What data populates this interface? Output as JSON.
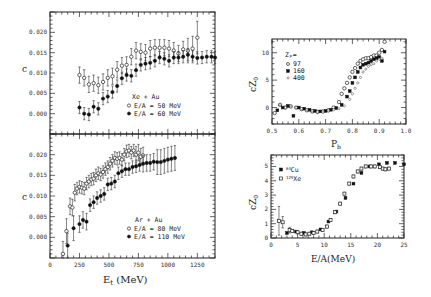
{
  "chart_data": [
    {
      "id": "xe-au",
      "type": "scatter",
      "title": "",
      "xlabel": "",
      "ylabel": "c",
      "xlim": [
        0,
        1400
      ],
      "ylim": [
        -0.005,
        0.025
      ],
      "yticks": [
        0.0,
        0.005,
        0.01,
        0.015,
        0.02
      ],
      "ytick_labels": [
        "0.000",
        "0.005",
        "0.010",
        "0.015",
        "0.020"
      ],
      "legend_title": "Xe + Au",
      "legend_position": "lower-center",
      "series": [
        {
          "name": "E/A = 50 MeV",
          "marker": "open-circle",
          "x": [
            250,
            290,
            330,
            370,
            410,
            450,
            490,
            530,
            570,
            610,
            650,
            690,
            730,
            770,
            810,
            850,
            890,
            930,
            970,
            1010,
            1050,
            1090,
            1130,
            1170,
            1210,
            1250
          ],
          "y": [
            0.0095,
            0.0088,
            0.0072,
            0.0075,
            0.007,
            0.0078,
            0.0088,
            0.0092,
            0.0108,
            0.0118,
            0.012,
            0.014,
            0.0155,
            0.0152,
            0.015,
            0.016,
            0.0162,
            0.0162,
            0.0162,
            0.016,
            0.0155,
            0.0148,
            0.0158,
            0.0155,
            0.016,
            0.0187
          ],
          "err": [
            0.002,
            0.002,
            0.002,
            0.002,
            0.002,
            0.002,
            0.002,
            0.002,
            0.002,
            0.002,
            0.002,
            0.002,
            0.002,
            0.002,
            0.002,
            0.002,
            0.002,
            0.002,
            0.002,
            0.002,
            0.002,
            0.002,
            0.002,
            0.003,
            0.003,
            0.004
          ]
        },
        {
          "name": "E/A = 60 MeV",
          "marker": "filled-circle",
          "x": [
            250,
            290,
            330,
            370,
            410,
            450,
            490,
            530,
            570,
            610,
            650,
            690,
            730,
            770,
            810,
            850,
            890,
            930,
            970,
            1010,
            1050,
            1090,
            1130,
            1170,
            1210,
            1250,
            1290,
            1330,
            1370,
            1400
          ],
          "y": [
            0.0015,
            0.0,
            -0.0002,
            0.0017,
            0.0012,
            0.0037,
            0.0042,
            0.0053,
            0.0068,
            0.0087,
            0.0095,
            0.0093,
            0.0107,
            0.012,
            0.0123,
            0.0125,
            0.013,
            0.0138,
            0.0135,
            0.013,
            0.0138,
            0.0138,
            0.014,
            0.0145,
            0.014,
            0.0137,
            0.0138,
            0.014,
            0.014,
            0.0138
          ],
          "err": [
            0.0015,
            0.0015,
            0.0015,
            0.0015,
            0.0015,
            0.0015,
            0.0015,
            0.0015,
            0.0015,
            0.0015,
            0.0015,
            0.0015,
            0.0015,
            0.0015,
            0.0015,
            0.0015,
            0.0015,
            0.0015,
            0.0015,
            0.0015,
            0.0015,
            0.0015,
            0.0015,
            0.0015,
            0.0015,
            0.0015,
            0.0015,
            0.0015,
            0.0015,
            0.0015
          ]
        }
      ]
    },
    {
      "id": "ar-au",
      "type": "scatter",
      "xlabel": "Eₜ (MeV)",
      "ylabel": "c",
      "xlim": [
        0,
        1400
      ],
      "ylim": [
        -0.005,
        0.025
      ],
      "xticks": [
        0,
        250,
        500,
        750,
        1000,
        1250
      ],
      "xtick_labels": [
        "0",
        "250",
        "500",
        "750",
        "1000",
        "1250"
      ],
      "yticks": [
        0.0,
        0.005,
        0.01,
        0.015,
        0.02
      ],
      "ytick_labels": [
        "0.000",
        "0.005",
        "0.010",
        "0.015",
        "0.020"
      ],
      "legend_title": "Ar + Au",
      "legend_position": "lower-right",
      "series": [
        {
          "name": "E/A = 80 MeV",
          "marker": "open-circle",
          "x": [
            110,
            140,
            170,
            190,
            210,
            230,
            250,
            270,
            290,
            310,
            330,
            350,
            370,
            390,
            410,
            430,
            450,
            470,
            490,
            510,
            530,
            550,
            570,
            590,
            610,
            630,
            650,
            670,
            690,
            710,
            730,
            750,
            770,
            790
          ],
          "y": [
            -0.004,
            0.0015,
            0.0075,
            0.0072,
            0.0108,
            0.0118,
            0.0122,
            0.012,
            0.0118,
            0.013,
            0.0135,
            0.014,
            0.0142,
            0.015,
            0.0155,
            0.0152,
            0.0158,
            0.0165,
            0.017,
            0.0178,
            0.0185,
            0.0192,
            0.019,
            0.0192,
            0.0188,
            0.02,
            0.0208,
            0.021,
            0.0205,
            0.021,
            0.02,
            0.0205,
            0.0195,
            0.0198
          ],
          "err": [
            0.003,
            0.003,
            0.002,
            0.002,
            0.002,
            0.0015,
            0.0015,
            0.0015,
            0.0015,
            0.0015,
            0.0015,
            0.0015,
            0.0015,
            0.0015,
            0.0015,
            0.0015,
            0.0015,
            0.0015,
            0.0015,
            0.0015,
            0.0015,
            0.0015,
            0.0015,
            0.0015,
            0.0015,
            0.0015,
            0.0015,
            0.0015,
            0.0015,
            0.0015,
            0.002,
            0.002,
            0.002,
            0.002
          ]
        },
        {
          "name": "E/A = 110 MeV",
          "marker": "filled-circle",
          "x": [
            150,
            200,
            250,
            280,
            310,
            340,
            370,
            400,
            430,
            460,
            490,
            520,
            550,
            580,
            610,
            640,
            670,
            700,
            730,
            760,
            790,
            820,
            850,
            880,
            910,
            940,
            970,
            1000,
            1030,
            1060
          ],
          "y": [
            -0.002,
            0.0022,
            0.0032,
            0.0042,
            0.0038,
            0.0078,
            0.0085,
            0.0095,
            0.01,
            0.0105,
            0.0128,
            0.013,
            0.0135,
            0.0155,
            0.016,
            0.0165,
            0.0165,
            0.017,
            0.0172,
            0.0175,
            0.0178,
            0.018,
            0.018,
            0.0183,
            0.0182,
            0.0182,
            0.0185,
            0.0188,
            0.019,
            0.0192
          ],
          "err": [
            0.003,
            0.003,
            0.002,
            0.002,
            0.002,
            0.0015,
            0.0015,
            0.0015,
            0.0015,
            0.0015,
            0.0015,
            0.0015,
            0.0015,
            0.0015,
            0.0015,
            0.0015,
            0.0015,
            0.0015,
            0.0015,
            0.0015,
            0.002,
            0.002,
            0.002,
            0.002,
            0.003,
            0.003,
            0.003,
            0.003,
            0.003,
            0.003
          ]
        }
      ]
    },
    {
      "id": "cz0-vs-pb",
      "type": "scatter",
      "xlabel": "Pₕ",
      "ylabel": "cZ₀",
      "xlim": [
        0.5,
        1.0
      ],
      "ylim": [
        -3,
        12.5
      ],
      "xticks": [
        0.5,
        0.6,
        0.7,
        0.8,
        0.9,
        1.0
      ],
      "xtick_labels": [
        "0.5",
        "0.6",
        "0.7",
        "0.8",
        "0.9",
        "1.0"
      ],
      "yticks": [
        0,
        5,
        10
      ],
      "ytick_labels": [
        "0",
        "5",
        "10"
      ],
      "legend_title": "Zₚ=",
      "legend_position": "upper-left",
      "series": [
        {
          "name": "97",
          "marker": "open-circle",
          "x": [
            0.51,
            0.53,
            0.55,
            0.57,
            0.59,
            0.61,
            0.63,
            0.65,
            0.67,
            0.69,
            0.71,
            0.73,
            0.75,
            0.76,
            0.77,
            0.78,
            0.79,
            0.8,
            0.81,
            0.82,
            0.83,
            0.84,
            0.85,
            0.86,
            0.87,
            0.88,
            0.89,
            0.9,
            0.91,
            0.92
          ],
          "y": [
            -1.0,
            0.5,
            0.0,
            0.2,
            0.0,
            -0.3,
            -0.5,
            -0.7,
            -0.8,
            -0.7,
            -0.5,
            0.0,
            1.0,
            2.5,
            3.5,
            4.5,
            5.5,
            6.5,
            7.2,
            8.0,
            8.5,
            8.8,
            9.0,
            9.0,
            9.2,
            9.5,
            9.5,
            10.0,
            10.5,
            12.0
          ]
        },
        {
          "name": "160",
          "marker": "filled-square",
          "x": [
            0.52,
            0.54,
            0.56,
            0.58,
            0.6,
            0.62,
            0.64,
            0.66,
            0.68,
            0.7,
            0.72,
            0.74,
            0.76,
            0.78,
            0.79,
            0.8,
            0.81,
            0.82,
            0.83,
            0.84,
            0.85,
            0.86,
            0.87,
            0.88,
            0.89,
            0.9,
            0.91,
            0.92
          ],
          "y": [
            -0.5,
            0.0,
            0.3,
            -1.5,
            0.0,
            -0.2,
            -0.4,
            -0.6,
            -0.7,
            -0.6,
            -0.4,
            -0.1,
            0.5,
            2.0,
            3.0,
            4.5,
            5.5,
            6.5,
            7.3,
            7.8,
            8.0,
            8.2,
            8.5,
            8.8,
            9.0,
            9.2,
            8.5,
            10.2
          ]
        },
        {
          "name": "400",
          "marker": "small-open-circle",
          "x": [
            0.53,
            0.55,
            0.57,
            0.59,
            0.61,
            0.63,
            0.65,
            0.67,
            0.69,
            0.71,
            0.73,
            0.75,
            0.77,
            0.79,
            0.8,
            0.81,
            0.82,
            0.83,
            0.84,
            0.85,
            0.86,
            0.87,
            0.88,
            0.89,
            0.9,
            0.91
          ],
          "y": [
            0.5,
            0.0,
            0.3,
            0.0,
            -0.2,
            -0.4,
            -0.6,
            -0.8,
            -0.8,
            -0.6,
            -0.4,
            -0.2,
            0.3,
            1.5,
            2.5,
            3.5,
            4.5,
            5.5,
            6.5,
            7.0,
            7.5,
            7.8,
            8.0,
            8.5,
            8.8,
            9.0
          ]
        }
      ]
    },
    {
      "id": "cz0-vs-ea",
      "type": "scatter",
      "xlabel": "E/A(MeV)",
      "ylabel": "cZ₀",
      "xlim": [
        0,
        25
      ],
      "ylim": [
        0,
        5.8
      ],
      "xticks": [
        0,
        5,
        10,
        15,
        20,
        25
      ],
      "xtick_labels": [
        "0",
        "5",
        "10",
        "15",
        "20",
        "25"
      ],
      "yticks": [
        0,
        1,
        2,
        3,
        4,
        5
      ],
      "ytick_labels": [
        "0",
        "1",
        "2",
        "3",
        "4",
        "5"
      ],
      "legend_position": "upper-left",
      "series": [
        {
          "name": "⁶⁴Cu",
          "marker": "filled-square",
          "x": [
            3.0,
            4.7,
            6.2,
            7.7,
            9.3,
            10.8,
            12.3,
            14.0,
            15.5,
            17.0,
            18.5,
            20.3,
            21.8,
            23.3,
            25.0
          ],
          "y": [
            0.35,
            0.45,
            0.35,
            0.4,
            0.6,
            1.15,
            1.85,
            2.8,
            3.8,
            4.55,
            5.0,
            5.15,
            5.25,
            5.25,
            5.15
          ]
        },
        {
          "name": "¹²⁹Xe",
          "marker": "open-square",
          "x": [
            1.5,
            2.2,
            3.5,
            4.0,
            5.0,
            5.7,
            6.5,
            7.2,
            8.0,
            8.7,
            9.7,
            10.5,
            11.2,
            12.0,
            13.0,
            13.8,
            14.7,
            15.5,
            16.3,
            17.0,
            17.8,
            18.8,
            19.5,
            20.5,
            21.0,
            21.5,
            22.2
          ],
          "y": [
            1.2,
            1.1,
            0.55,
            0.5,
            0.4,
            0.3,
            0.25,
            0.3,
            0.35,
            0.45,
            0.55,
            0.8,
            1.25,
            1.8,
            2.4,
            3.1,
            3.8,
            4.3,
            4.65,
            4.85,
            5.0,
            5.0,
            5.0,
            4.95,
            4.85,
            4.8,
            4.85
          ],
          "err": [
            1.0,
            0.4,
            0.2,
            0.1,
            0.1,
            0.1,
            0.1,
            0.1,
            0.1,
            0.1,
            0.1,
            0.1,
            0.1,
            0.1,
            0.1,
            0.1,
            0.1,
            0.1,
            0.1,
            0.1,
            0.1,
            0.1,
            0.1,
            0.1,
            0.1,
            0.1,
            0.1
          ]
        }
      ]
    }
  ],
  "labels": {
    "xe_ylabel": "c",
    "ar_ylabel": "c",
    "left_xlabel_main": "E",
    "left_xlabel_sub": "t",
    "left_xlabel_unit": " (MeV)",
    "pb_xlabel_main": "P",
    "pb_xlabel_sub": "b",
    "cz_ylabel_main": "cZ",
    "cz_ylabel_sub": "0",
    "ea_xlabel": "E/A(MeV)",
    "xe_legend_title": "Xe + Au",
    "xe_leg1": "E/A = 50 MeV",
    "xe_leg2": "E/A = 60 MeV",
    "ar_legend_title": "Ar + Au",
    "ar_leg1": "E/A = 80 MeV",
    "ar_leg2": "E/A = 110 MeV",
    "pb_legend_title": "Zₚ=",
    "pb_leg1": "97",
    "pb_leg2": "160",
    "pb_leg3": "400",
    "ea_leg1_sup": "64",
    "ea_leg1": "Cu",
    "ea_leg2_sup": "129",
    "ea_leg2": "Xe"
  }
}
